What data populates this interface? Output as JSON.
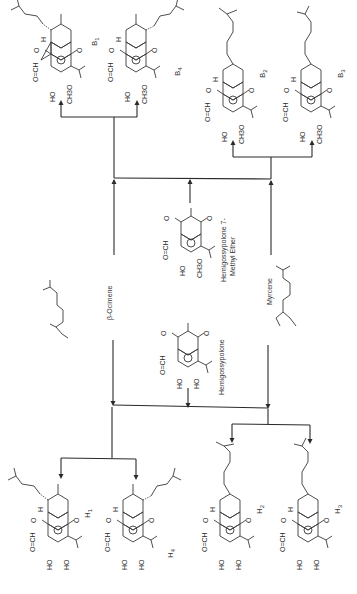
{
  "diagram": {
    "orientation": "rotated-90-ccw",
    "products_top": [
      {
        "id": "B1",
        "label": "B",
        "sub": "1",
        "substituents": [
          "O=CH",
          "HO",
          "CH3O"
        ],
        "sidechain": "prenyl (dashed)",
        "H": "H"
      },
      {
        "id": "B4",
        "label": "B",
        "sub": "4",
        "substituents": [
          "O=CH",
          "HO",
          "CH3O"
        ],
        "sidechain": "prenyl (dashed)",
        "H": "H"
      },
      {
        "id": "B2",
        "label": "B",
        "sub": "2",
        "substituents": [
          "O=CH",
          "HO",
          "CH3O"
        ],
        "sidechain": "homoprenyl chain",
        "H": "H"
      },
      {
        "id": "B3",
        "label": "B",
        "sub": "3",
        "substituents": [
          "O=CH",
          "HO",
          "CH3O"
        ],
        "sidechain": "homoprenyl chain",
        "H": "H"
      }
    ],
    "reactants": [
      {
        "id": "ocimene",
        "name": "β-Ocimene"
      },
      {
        "id": "hgme",
        "name_line1": "Hemigossypolone 7-",
        "name_line2": "Methyl Ether",
        "substituents": [
          "O=CH",
          "HO",
          "CH3O"
        ]
      },
      {
        "id": "myrcene",
        "name": "Myrcene"
      },
      {
        "id": "hg",
        "name": "Hemigossypolone",
        "substituents": [
          "O=CH",
          "HO",
          "HO"
        ]
      }
    ],
    "products_bottom": [
      {
        "id": "H1",
        "label": "H",
        "sub": "1",
        "substituents": [
          "O=CH",
          "HO",
          "HO"
        ],
        "H": "H"
      },
      {
        "id": "H4",
        "label": "H",
        "sub": "4",
        "substituents": [
          "O=CH",
          "HO",
          "HO"
        ],
        "H": "H"
      },
      {
        "id": "H2",
        "label": "H",
        "sub": "2",
        "substituents": [
          "O=CH",
          "HO",
          "HO"
        ],
        "H": "H"
      },
      {
        "id": "H3",
        "label": "H",
        "sub": "3",
        "substituents": [
          "O=CH",
          "HO",
          "HO"
        ],
        "H": "H"
      }
    ],
    "atoms": {
      "carbonyl": "O",
      "aldehyde": "O=CH",
      "hydroxyl": "HO",
      "methoxy": "CH3O",
      "hydrogen": "H"
    }
  }
}
